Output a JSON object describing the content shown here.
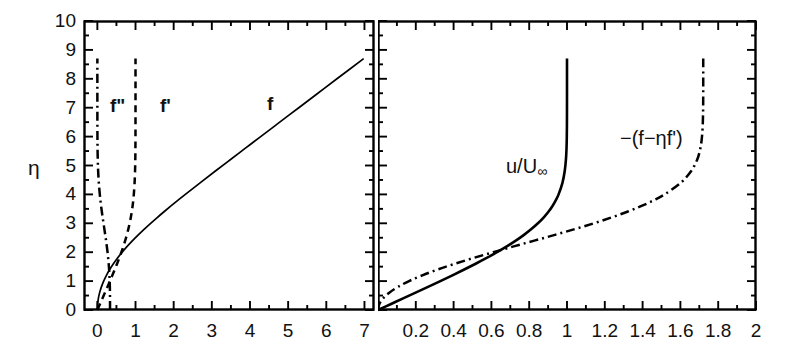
{
  "figure": {
    "background": "#ffffff",
    "ink": "#000000",
    "width": 790,
    "height": 360,
    "ylabel": "η"
  },
  "chart_data": [
    {
      "type": "line",
      "panel": "left",
      "title": "",
      "xlabel": "",
      "ylabel": "η",
      "xlim": [
        -0.35,
        7.25
      ],
      "ylim": [
        0,
        10
      ],
      "xticks": [
        0,
        1,
        2,
        3,
        4,
        5,
        6,
        7
      ],
      "xticklabels": [
        "0",
        "1",
        "2",
        "3",
        "4",
        "5",
        "6",
        "7"
      ],
      "xminor_step": 0.5,
      "yticks": [
        0,
        1,
        2,
        3,
        4,
        5,
        6,
        7,
        8,
        9,
        10
      ],
      "yticklabels": [
        "0",
        "1",
        "2",
        "3",
        "4",
        "5",
        "6",
        "7",
        "8",
        "9",
        "10"
      ],
      "yminor_step": 0.5,
      "grid": false,
      "legend": "inline-annotations",
      "eta": [
        0,
        0.2,
        0.4,
        0.6,
        0.8,
        1.0,
        1.2,
        1.4,
        1.6,
        1.8,
        2.0,
        2.2,
        2.4,
        2.6,
        2.8,
        3.0,
        3.2,
        3.4,
        3.6,
        3.8,
        4.0,
        4.4,
        4.8,
        5.2,
        5.6,
        6.0,
        6.5,
        7.0,
        7.5,
        8.0,
        8.7
      ],
      "series": [
        {
          "name": "f",
          "label": "f",
          "style": "solid",
          "values": [
            0.0,
            0.0066,
            0.0266,
            0.0597,
            0.1061,
            0.1656,
            0.2379,
            0.323,
            0.4203,
            0.5295,
            0.65,
            0.7812,
            0.9223,
            1.0725,
            1.231,
            1.3968,
            1.5691,
            1.747,
            1.9295,
            2.1161,
            2.3057,
            2.6924,
            3.0853,
            3.4819,
            3.8803,
            4.2796,
            4.7793,
            5.2793,
            5.7793,
            6.2793,
            6.9793
          ]
        },
        {
          "name": "f'",
          "label": "f'",
          "style": "dashed",
          "values": [
            0.0,
            0.0664,
            0.1328,
            0.1989,
            0.2647,
            0.3298,
            0.3938,
            0.4563,
            0.5168,
            0.5748,
            0.6298,
            0.6813,
            0.729,
            0.7725,
            0.8115,
            0.8461,
            0.8761,
            0.9018,
            0.9233,
            0.9411,
            0.9555,
            0.9759,
            0.9878,
            0.9943,
            0.9975,
            0.999,
            0.9997,
            0.9999,
            1.0,
            1.0,
            1.0
          ]
        },
        {
          "name": "f''",
          "label": "f\"",
          "style": "dashdot",
          "values": [
            0.3321,
            0.332,
            0.3315,
            0.3301,
            0.3274,
            0.323,
            0.3166,
            0.3079,
            0.2967,
            0.283,
            0.2668,
            0.2484,
            0.2281,
            0.2065,
            0.184,
            0.1614,
            0.1391,
            0.1179,
            0.0981,
            0.0801,
            0.0642,
            0.0386,
            0.0211,
            0.0108,
            0.005,
            0.0022,
            0.0007,
            0.0002,
            0.0001,
            0.0,
            0.0
          ]
        }
      ],
      "annotations": [
        {
          "text": "f\"",
          "x_px": 110,
          "y_px": 96
        },
        {
          "text": "f'",
          "x_px": 160,
          "y_px": 96
        },
        {
          "text": "f",
          "x_px": 267,
          "y_px": 94
        }
      ]
    },
    {
      "type": "line",
      "panel": "right",
      "title": "",
      "xlabel": "",
      "ylabel": "η",
      "xlim": [
        0,
        2
      ],
      "ylim": [
        0,
        10
      ],
      "xticks": [
        0,
        0.2,
        0.4,
        0.6,
        0.8,
        1.0,
        1.2,
        1.4,
        1.6,
        1.8,
        2.0
      ],
      "xticklabels": [
        "",
        "0.2",
        "0.4",
        "0.6",
        "0.8",
        "1",
        "1.2",
        "1.4",
        "1.6",
        "1.8",
        "2"
      ],
      "xminor_step": 0.1,
      "yticks": [
        0,
        1,
        2,
        3,
        4,
        5,
        6,
        7,
        8,
        9,
        10
      ],
      "yticklabels": [],
      "yminor_step": 0.5,
      "grid": false,
      "legend": "inline-annotations",
      "eta": [
        0,
        0.2,
        0.4,
        0.6,
        0.8,
        1.0,
        1.2,
        1.4,
        1.6,
        1.8,
        2.0,
        2.2,
        2.4,
        2.6,
        2.8,
        3.0,
        3.2,
        3.4,
        3.6,
        3.8,
        4.0,
        4.4,
        4.8,
        5.2,
        5.6,
        6.0,
        6.5,
        7.0,
        7.5,
        8.0,
        8.7
      ],
      "series": [
        {
          "name": "u/Uinf",
          "label": "u/U∞",
          "style": "solid",
          "values": [
            0.0,
            0.0664,
            0.1328,
            0.1989,
            0.2647,
            0.3298,
            0.3938,
            0.4563,
            0.5168,
            0.5748,
            0.6298,
            0.6813,
            0.729,
            0.7725,
            0.8115,
            0.8461,
            0.8761,
            0.9018,
            0.9233,
            0.9411,
            0.9555,
            0.9759,
            0.9878,
            0.9943,
            0.9975,
            0.999,
            0.9997,
            0.9999,
            1.0,
            1.0,
            1.0
          ]
        },
        {
          "name": "-(f-eta*f')",
          "label": "−(f−ηf')",
          "style": "dashdot",
          "values": [
            0.0,
            0.0067,
            0.0265,
            0.0596,
            0.1057,
            0.1642,
            0.2347,
            0.3158,
            0.4066,
            0.5052,
            0.6097,
            0.7177,
            0.8273,
            0.936,
            1.0412,
            1.1415,
            1.2345,
            1.3191,
            1.3944,
            1.4601,
            1.5163,
            1.6016,
            1.6562,
            1.6887,
            1.7058,
            1.7142,
            1.7187,
            1.7203,
            1.7207,
            1.7208,
            1.7208
          ]
        }
      ],
      "annotations": [
        {
          "text": "u/U∞",
          "x_px": 506,
          "y_px": 156
        },
        {
          "text": "−(f−ηf')",
          "x_px": 620,
          "y_px": 128
        }
      ]
    }
  ]
}
